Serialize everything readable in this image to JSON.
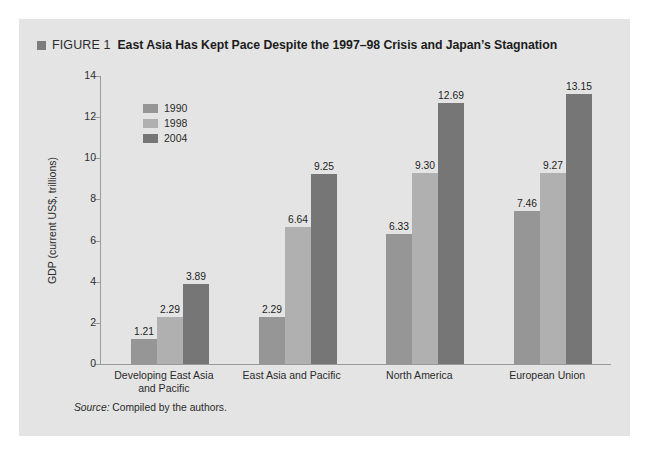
{
  "figure": {
    "bullet_icon": "square-bullet-icon",
    "number": "FIGURE 1",
    "title": "East Asia Has Kept Pace Despite the 1997–98 Crisis and Japan’s Stagnation"
  },
  "source": {
    "label": "Source:",
    "text": " Compiled by the authors."
  },
  "colors": {
    "panel_background": "#e4e4e4",
    "page_background": "#ffffff",
    "axis": "#9a9a9a",
    "bullet": "#7d7d7d",
    "series_1990": "#969696",
    "series_1998": "#b0b0b0",
    "series_2004": "#767676"
  },
  "chart_data": {
    "type": "bar",
    "title": "East Asia Has Kept Pace Despite the 1997–98 Crisis and Japan’s Stagnation",
    "xlabel": "",
    "ylabel": "GDP (current US$, trillions)",
    "ylim": [
      0,
      14
    ],
    "yticks": [
      0,
      2,
      4,
      6,
      8,
      10,
      12,
      14
    ],
    "ytick_labels": [
      "0",
      "2",
      "4",
      "6",
      "8",
      "10",
      "12",
      "14"
    ],
    "grid": false,
    "legend_position": "top-left inside plot",
    "categories": [
      "Developing East Asia\nand Pacific",
      "East Asia and Pacific",
      "North America",
      "European Union"
    ],
    "series": [
      {
        "name": "1990",
        "color": "#969696",
        "values": [
          1.21,
          2.29,
          6.33,
          7.46
        ],
        "labels": [
          "1.21",
          "2.29",
          "6.33",
          "7.46"
        ]
      },
      {
        "name": "1998",
        "color": "#b0b0b0",
        "values": [
          2.29,
          6.64,
          9.3,
          9.27
        ],
        "labels": [
          "2.29",
          "6.64",
          "9.30",
          "9.27"
        ]
      },
      {
        "name": "2004",
        "color": "#767676",
        "values": [
          3.89,
          9.25,
          12.69,
          13.15
        ],
        "labels": [
          "3.89",
          "9.25",
          "12.69",
          "13.15"
        ]
      }
    ],
    "bars": [
      {
        "category": "Developing East Asia and Pacific",
        "series": "1990",
        "value": 1.21,
        "label": "1.21"
      },
      {
        "category": "Developing East Asia and Pacific",
        "series": "1998",
        "value": 2.29,
        "label": "2.29"
      },
      {
        "category": "Developing East Asia and Pacific",
        "series": "2004",
        "value": 3.89,
        "label": "3.89"
      },
      {
        "category": "East Asia and Pacific",
        "series": "1990",
        "value": 4.6,
        "label": "4.60"
      },
      {
        "category": "East Asia and Pacific",
        "series": "1998",
        "value": 6.64,
        "label": "6.64"
      },
      {
        "category": "East Asia and Pacific",
        "series": "2004",
        "value": 9.25,
        "label": "9.25"
      },
      {
        "category": "North America",
        "series": "1990",
        "value": 6.33,
        "label": "6.33"
      },
      {
        "category": "North America",
        "series": "1998",
        "value": 9.3,
        "label": "9.30"
      },
      {
        "category": "North America",
        "series": "2004",
        "value": 12.69,
        "label": "12.69"
      },
      {
        "category": "European Union",
        "series": "1990",
        "value": 7.46,
        "label": "7.46"
      },
      {
        "category": "European Union",
        "series": "1998",
        "value": 9.27,
        "label": "9.27"
      },
      {
        "category": "European Union",
        "series": "2004",
        "value": 13.15,
        "label": "13.15"
      }
    ]
  }
}
